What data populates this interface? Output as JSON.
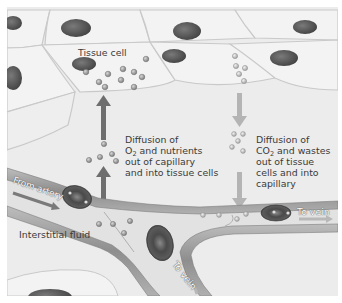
{
  "figure": {
    "labels": {
      "tissue_cell": "Tissue cell",
      "interstitial_fluid": "Interstitial fluid",
      "from_artery": "From artery",
      "to_vein_right": "To vein",
      "to_vein_bottom": "To vein"
    },
    "diffusion_in": {
      "line1": "Diffusion of",
      "line2_prefix": "O",
      "line2_sub": "2",
      "line2_suffix": " and nutrients",
      "line3": "out of capillary",
      "line4": "and into tissue cells"
    },
    "diffusion_out": {
      "line1": "Diffusion of",
      "line2_prefix": "CO",
      "line2_sub": "2",
      "line2_suffix": " and wastes",
      "line3": "out of tissue",
      "line4": "cells and into",
      "line5": "capillary"
    },
    "colors": {
      "background": "#ececec",
      "cell_fill": "#f3f3f3",
      "cell_outline": "#c9c9c9",
      "nucleus": "#5a5a5a",
      "arrow_dark": "#6e6e6e",
      "arrow_light": "#b4b4b4",
      "vessel_wall": "#9a9a9a",
      "red_blood_cell": "#4d4d4d",
      "text": "#3a3a3a"
    }
  }
}
